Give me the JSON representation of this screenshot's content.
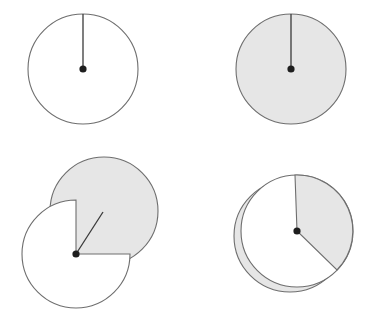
{
  "diagram": {
    "title": "",
    "colors": {
      "background": "#ffffff",
      "disk_white": "#ffffff",
      "disk_gray": "#e6e6e6",
      "outline": "#6e6e6e",
      "needle": "#3a3a3a",
      "pivot": "#1e1e1e"
    },
    "panels": [
      {
        "id": "panel-1",
        "description": "White disk with vertical needle from center to top",
        "disk": {
          "cx": 83,
          "cy": 69,
          "r": 55,
          "fill": "white"
        },
        "needle": {
          "x2": 83,
          "y2": 14
        },
        "pivot": {
          "cx": 83,
          "cy": 69,
          "r": 3.6
        }
      },
      {
        "id": "panel-2",
        "description": "Gray disk with vertical needle from center to top",
        "disk": {
          "cx": 291,
          "cy": 69,
          "r": 55,
          "fill": "gray"
        },
        "needle": {
          "x2": 291,
          "y2": 14
        },
        "pivot": {
          "cx": 291,
          "cy": 69,
          "r": 3.6
        }
      },
      {
        "id": "panel-3",
        "description": "White disk with quarter cut out revealing offset gray disk behind; needle angled up-right",
        "back_disk": {
          "cx": 104,
          "cy": 211,
          "r": 54,
          "fill": "gray"
        },
        "front_disk": {
          "cx": 76,
          "cy": 254,
          "r": 54,
          "fill": "white",
          "cutout": "upper-right quarter"
        },
        "needle": {
          "x2": 103,
          "y2": 212
        },
        "pivot": {
          "cx": 76,
          "cy": 254,
          "r": 3.6
        }
      },
      {
        "id": "panel-4",
        "description": "White disk with gray sector (clockwise from top) over an offset gray disk showing a crescent",
        "back_disk": {
          "cx": 290,
          "cy": 236,
          "r": 56,
          "fill": "gray"
        },
        "front_disk": {
          "cx": 297,
          "cy": 231,
          "r": 56,
          "fill": "white"
        },
        "sector": {
          "start_x": 295,
          "start_y": 175,
          "end_x": 337,
          "end_y": 269,
          "fill": "gray"
        },
        "pivot": {
          "cx": 297,
          "cy": 231,
          "r": 3.6
        }
      }
    ]
  }
}
